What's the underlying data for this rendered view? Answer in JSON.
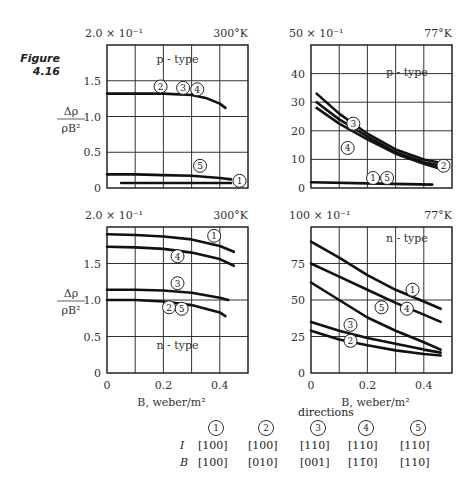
{
  "figure": {
    "label": "Figure",
    "number": "4.16"
  },
  "ylabel": {
    "num": "Δρ",
    "den": "ρB²"
  },
  "xlabel": "B, weber/m²",
  "chart_data": [
    {
      "type": "line",
      "panel": "top-left",
      "title": "p - type",
      "temperature": "300°K",
      "scale_label": "2.0 × 10⁻¹",
      "xlabel": "B, weber/m²",
      "ylabel": "Δρ/ρB²",
      "xlim": [
        0,
        0.5
      ],
      "ylim": [
        0,
        2.0
      ],
      "yticks": [
        "0",
        "0.5",
        "1.0",
        "1.5"
      ],
      "grid": true,
      "series": [
        {
          "name": "2,3,4",
          "x": [
            0,
            0.1,
            0.2,
            0.3,
            0.35,
            0.4,
            0.42
          ],
          "y": [
            1.32,
            1.32,
            1.32,
            1.3,
            1.26,
            1.18,
            1.12
          ]
        },
        {
          "name": "5",
          "x": [
            0,
            0.1,
            0.2,
            0.3,
            0.4,
            0.44
          ],
          "y": [
            0.19,
            0.19,
            0.18,
            0.17,
            0.14,
            0.12
          ]
        },
        {
          "name": "1",
          "x": [
            0.05,
            0.2,
            0.3,
            0.44
          ],
          "y": [
            0.07,
            0.07,
            0.07,
            0.07
          ]
        }
      ]
    },
    {
      "type": "line",
      "panel": "top-right",
      "title": "p - type",
      "temperature": "77°K",
      "scale_label": "50 × 10⁻¹",
      "xlabel": "B, weber/m²",
      "ylabel": "Δρ/ρB²",
      "xlim": [
        0,
        0.5
      ],
      "ylim": [
        0,
        50
      ],
      "yticks": [
        "0",
        "10",
        "20",
        "30",
        "40"
      ],
      "grid": true,
      "series": [
        {
          "name": "3",
          "x": [
            0.02,
            0.1,
            0.2,
            0.3,
            0.4,
            0.45
          ],
          "y": [
            33,
            26,
            19,
            13.5,
            10,
            9
          ]
        },
        {
          "name": "2",
          "x": [
            0.02,
            0.1,
            0.2,
            0.3,
            0.4,
            0.45
          ],
          "y": [
            30,
            24,
            18,
            12.5,
            9,
            8
          ]
        },
        {
          "name": "4",
          "x": [
            0.02,
            0.1,
            0.2,
            0.3,
            0.4,
            0.45
          ],
          "y": [
            28,
            22.5,
            17,
            12,
            8.5,
            7
          ]
        },
        {
          "name": "1,5",
          "x": [
            0,
            0.2,
            0.43
          ],
          "y": [
            2,
            1.6,
            1.2
          ]
        }
      ]
    },
    {
      "type": "line",
      "panel": "bottom-left",
      "title": "n - type",
      "temperature": "300°K",
      "scale_label": "2.0 × 10⁻¹",
      "xlabel": "B, weber/m²",
      "ylabel": "Δρ/ρB²",
      "xlim": [
        0,
        0.5
      ],
      "ylim": [
        0,
        2.0
      ],
      "yticks": [
        "0",
        "0.5",
        "1.0",
        "1.5"
      ],
      "xticks": [
        "0",
        "0.2",
        "0.4"
      ],
      "grid": true,
      "series": [
        {
          "name": "1",
          "x": [
            0,
            0.1,
            0.2,
            0.3,
            0.4,
            0.45
          ],
          "y": [
            1.9,
            1.89,
            1.87,
            1.83,
            1.74,
            1.66
          ]
        },
        {
          "name": "4",
          "x": [
            0,
            0.1,
            0.2,
            0.3,
            0.4,
            0.45
          ],
          "y": [
            1.73,
            1.72,
            1.7,
            1.65,
            1.56,
            1.47
          ]
        },
        {
          "name": "3",
          "x": [
            0,
            0.1,
            0.2,
            0.3,
            0.4,
            0.43
          ],
          "y": [
            1.14,
            1.14,
            1.13,
            1.1,
            1.03,
            1.0
          ]
        },
        {
          "name": "2,5",
          "x": [
            0,
            0.1,
            0.2,
            0.3,
            0.4,
            0.42
          ],
          "y": [
            1.0,
            1.0,
            0.98,
            0.93,
            0.83,
            0.78
          ]
        }
      ]
    },
    {
      "type": "line",
      "panel": "bottom-right",
      "title": "n - type",
      "temperature": "77°K",
      "scale_label": "100 × 10⁻¹",
      "xlabel": "B, weber/m²",
      "ylabel": "Δρ/ρB²",
      "xlim": [
        0,
        0.5
      ],
      "ylim": [
        0,
        100
      ],
      "yticks": [
        "0",
        "25",
        "50",
        "75"
      ],
      "xticks": [
        "0",
        "0.2",
        "0.4"
      ],
      "grid": true,
      "series": [
        {
          "name": "1",
          "x": [
            0,
            0.1,
            0.2,
            0.3,
            0.4,
            0.46
          ],
          "y": [
            90,
            79,
            67,
            57,
            49,
            44
          ]
        },
        {
          "name": "4",
          "x": [
            0,
            0.1,
            0.2,
            0.3,
            0.4,
            0.46
          ],
          "y": [
            75,
            66,
            57,
            48,
            40,
            35
          ]
        },
        {
          "name": "5",
          "x": [
            0,
            0.1,
            0.2,
            0.3,
            0.4,
            0.46
          ],
          "y": [
            62,
            50,
            38,
            29,
            21,
            16
          ]
        },
        {
          "name": "3",
          "x": [
            0,
            0.1,
            0.2,
            0.3,
            0.4,
            0.46
          ],
          "y": [
            35,
            29,
            24,
            20,
            16,
            14
          ]
        },
        {
          "name": "2",
          "x": [
            0,
            0.1,
            0.2,
            0.3,
            0.4,
            0.46
          ],
          "y": [
            29,
            23,
            19,
            15.5,
            13,
            12
          ]
        }
      ]
    }
  ],
  "directions": {
    "title": "directions",
    "columns": [
      "1",
      "2",
      "3",
      "4",
      "5"
    ],
    "rows": [
      {
        "label": "I",
        "values": [
          "[100]",
          "[100]",
          "[110]",
          "[110]",
          "[110]"
        ]
      },
      {
        "label": "B",
        "values": [
          "[100]",
          "[010]",
          "[001]",
          "[11̄0]",
          "[110]"
        ]
      }
    ]
  }
}
